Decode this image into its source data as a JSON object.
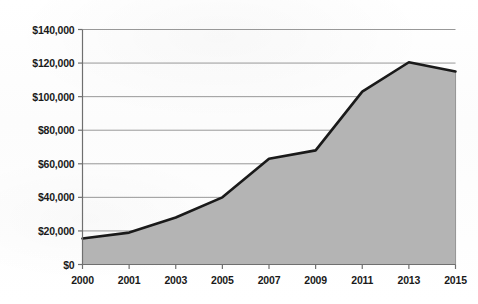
{
  "chart_data": {
    "type": "area",
    "title": "",
    "subtitle": "",
    "xlabel": "",
    "ylabel": "",
    "categories": [
      "2000",
      "2001",
      "2003",
      "2005",
      "2007",
      "2009",
      "2011",
      "2013",
      "2015"
    ],
    "values": [
      15500,
      19000,
      28000,
      40000,
      63000,
      68000,
      103000,
      120500,
      115000
    ],
    "series": [
      {
        "name": "",
        "values": [
          15500,
          19000,
          28000,
          40000,
          63000,
          68000,
          103000,
          120500,
          115000
        ]
      }
    ],
    "ylim": [
      0,
      140000
    ],
    "ytick_values": [
      0,
      20000,
      40000,
      60000,
      80000,
      100000,
      120000,
      140000
    ],
    "ytick_labels": [
      "$0",
      "$20,000",
      "$40,000",
      "$60,000",
      "$80,000",
      "$100,000",
      "$120,000",
      "$140,000"
    ],
    "xtick_labels": [
      "2000",
      "2001",
      "2003",
      "2005",
      "2007",
      "2009",
      "2011",
      "2013",
      "2015"
    ],
    "grid": {
      "horizontal": true,
      "vertical": true
    },
    "legend": {
      "visible": false,
      "position": "none",
      "entries": []
    },
    "colors": {
      "area_fill": "#b4b4b4",
      "line": "#1a1a1a",
      "gridline_horizontal": "#8c8c8c",
      "gridline_vertical": "#7d7d7d",
      "axis": "#6f6f6f",
      "tick_text": "#1a1a1a",
      "background": "#fdfdfd"
    },
    "annotations": []
  }
}
